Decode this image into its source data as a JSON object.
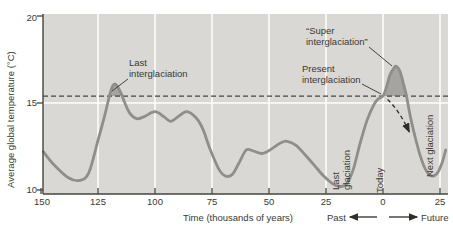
{
  "chart_data": {
    "type": "line",
    "title": "",
    "xlabel": "Time (thousands of years)",
    "ylabel": "Average global temperature (°C)",
    "xlim_kyr_before_present": [
      150,
      -28
    ],
    "ylim_c": [
      9.8,
      20.1
    ],
    "grid": "white gridlines on gray plot area",
    "equilibrium_temp_c": 15.4,
    "x_ticks": [
      {
        "t": 150,
        "label": "150",
        "grid": false
      },
      {
        "t": 125,
        "label": "125",
        "grid": true
      },
      {
        "t": 100,
        "label": "100",
        "grid": true
      },
      {
        "t": 75,
        "label": "75",
        "grid": true
      },
      {
        "t": 50,
        "label": "50",
        "grid": true
      },
      {
        "t": 25,
        "label": "25",
        "grid": true
      },
      {
        "t": 0,
        "label": "0",
        "grid": true
      },
      {
        "t": -25,
        "label": "25",
        "grid": true
      }
    ],
    "y_ticks": [
      {
        "temp": 20,
        "label": "20",
        "grid": false
      },
      {
        "temp": 15,
        "label": "15",
        "grid": true
      },
      {
        "temp": 10,
        "label": "10",
        "grid": false
      }
    ],
    "direction_labels": {
      "past": "Past",
      "future": "Future"
    },
    "series": [
      {
        "name": "Average global temperature",
        "points_t_kyr_temp_c": [
          [
            149,
            12.2
          ],
          [
            144,
            11.4
          ],
          [
            138,
            10.7
          ],
          [
            133,
            10.55
          ],
          [
            129,
            11.0
          ],
          [
            125,
            12.85
          ],
          [
            122,
            14.3
          ],
          [
            120,
            15.4
          ],
          [
            118.5,
            16.0
          ],
          [
            117,
            16.05
          ],
          [
            115,
            15.6
          ],
          [
            113.5,
            15.1
          ],
          [
            111,
            14.4
          ],
          [
            108,
            14.1
          ],
          [
            105,
            14.2
          ],
          [
            100,
            14.5
          ],
          [
            96,
            14.2
          ],
          [
            93,
            13.95
          ],
          [
            89,
            14.3
          ],
          [
            86,
            14.5
          ],
          [
            82,
            14.15
          ],
          [
            79,
            13.5
          ],
          [
            76,
            12.4
          ],
          [
            72,
            11.2
          ],
          [
            69,
            10.8
          ],
          [
            66,
            10.9
          ],
          [
            63,
            11.6
          ],
          [
            60,
            12.3
          ],
          [
            57,
            12.25
          ],
          [
            53,
            12.1
          ],
          [
            49,
            12.35
          ],
          [
            45,
            12.7
          ],
          [
            42,
            12.8
          ],
          [
            38,
            12.55
          ],
          [
            34,
            12.0
          ],
          [
            30,
            11.4
          ],
          [
            26,
            10.8
          ],
          [
            22,
            10.35
          ],
          [
            19,
            10.2
          ],
          [
            16,
            10.35
          ],
          [
            13,
            11.2
          ],
          [
            10,
            12.7
          ],
          [
            7,
            14.0
          ],
          [
            4,
            14.9
          ],
          [
            2,
            15.25
          ],
          [
            0,
            15.4
          ],
          [
            -1.5,
            15.9
          ],
          [
            -3,
            16.6
          ],
          [
            -5,
            17.05
          ],
          [
            -6,
            17.1
          ],
          [
            -7.5,
            16.8
          ],
          [
            -9,
            16.1
          ],
          [
            -10.3,
            15.4
          ],
          [
            -12,
            14.2
          ],
          [
            -14,
            13.1
          ],
          [
            -16.5,
            11.9
          ],
          [
            -19,
            11.1
          ],
          [
            -21.5,
            10.8
          ],
          [
            -24,
            11.0
          ],
          [
            -26,
            11.6
          ],
          [
            -27.5,
            12.3
          ]
        ]
      }
    ],
    "shaded_regions": [
      {
        "name": "last-interglaciation-excess",
        "points": [
          [
            120,
            15.4
          ],
          [
            119,
            15.75
          ],
          [
            118.5,
            16.0
          ],
          [
            117,
            16.05
          ],
          [
            115.5,
            15.75
          ],
          [
            114,
            15.4
          ]
        ]
      },
      {
        "name": "super-interglaciation-excess",
        "points": [
          [
            0,
            15.4
          ],
          [
            -1.5,
            15.9
          ],
          [
            -3,
            16.6
          ],
          [
            -5,
            17.05
          ],
          [
            -6,
            17.1
          ],
          [
            -7.5,
            16.8
          ],
          [
            -9,
            16.1
          ],
          [
            -10.3,
            15.4
          ]
        ]
      }
    ],
    "projection_arrow": {
      "from": [
        -2,
        15.2
      ],
      "ctrl": [
        -7,
        14.6
      ],
      "to": [
        -11.5,
        13.35
      ]
    },
    "annotations": [
      {
        "id": "last-interglaciation",
        "lines": [
          "Last",
          "interglaciation"
        ],
        "leader": [
          128,
          79,
          112,
          91
        ]
      },
      {
        "id": "super-interglaciation",
        "lines": [
          "“Super",
          "interglaciation”"
        ],
        "leader": [
          369,
          47,
          392,
          66
        ]
      },
      {
        "id": "present-interglaciation",
        "lines": [
          "Present",
          "interglaciation"
        ],
        "leader": [
          362,
          84,
          381,
          94
        ]
      },
      {
        "id": "last-glaciation",
        "lines": [
          "Last",
          "glaciation"
        ]
      },
      {
        "id": "today",
        "lines": [
          "Today"
        ]
      },
      {
        "id": "next-glaciation",
        "lines": [
          "Next glaciation"
        ]
      }
    ],
    "layout": {
      "x0_px": 383,
      "px_per_kyr": 2.28,
      "y15_px": 103,
      "px_per_deg": 17.4,
      "plot": {
        "left": 43,
        "right": 448,
        "top": 14,
        "bottom": 194
      },
      "past_arrow": {
        "x1": 377,
        "x2": 350,
        "y": 217
      },
      "future_arrow": {
        "x1": 389,
        "x2": 417,
        "y": 217
      }
    },
    "colors": {
      "plot_bg": "#d9d8d4",
      "grid": "#ffffff",
      "curve": "#8f8e8a",
      "shade": "#a5a4a0",
      "axis": "#45443f",
      "text": "#3a3934",
      "arrow": "#2e2d29"
    }
  }
}
